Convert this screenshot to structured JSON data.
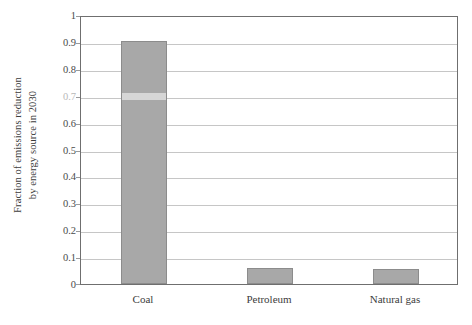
{
  "chart_data": {
    "type": "bar",
    "title": "",
    "xlabel": "",
    "ylabel": "Fraction of emissions reduction by energy source in 2030",
    "ylabel_lines": [
      "Fraction of emissions reduction",
      "by energy source in 2030"
    ],
    "categories": [
      "Coal",
      "Petroleum",
      "Natural gas"
    ],
    "values": [
      0.905,
      0.06,
      0.055
    ],
    "ylim": [
      0,
      1
    ],
    "ytick_values": [
      0,
      0.1,
      0.2,
      0.3,
      0.4,
      0.5,
      0.6,
      0.7,
      0.8,
      0.9,
      1
    ],
    "ytick_labels": [
      "0",
      "0.1",
      "0.2",
      "0.3",
      "0.4",
      "0.5",
      "0.6",
      "0.7",
      "0.8",
      "0.9",
      "1"
    ],
    "grid": true,
    "legend": false,
    "legend_position": "none",
    "bar_color": "#a8a8a8",
    "bar_border_color": "#8c8c8c",
    "gridline_color": "#c6c6c6",
    "axis_color": "#6f6f6f",
    "background_color": "#ffffff"
  }
}
